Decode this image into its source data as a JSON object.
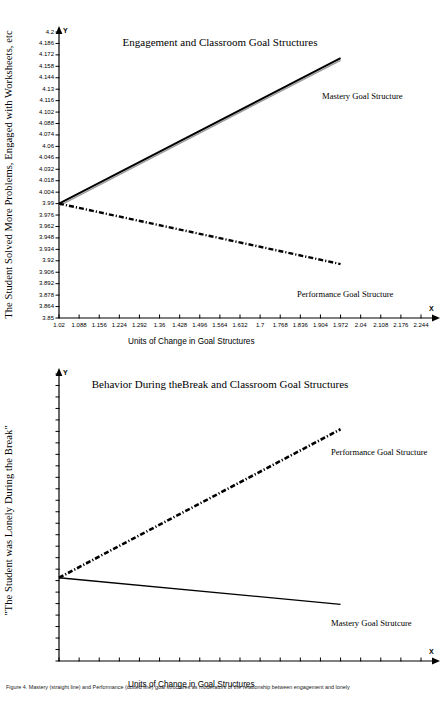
{
  "colors": {
    "ink": "#000000",
    "axis": "#000000",
    "page": "#ffffff"
  },
  "figures": [
    {
      "title": "Engagement and Classroom Goal Structures",
      "ylabel": "The Student Solved More Problems, Engaged with Worksheets, etc",
      "xlabel": "Units of Change in Goal Structures",
      "y_axis_mark": "Y",
      "x_axis_mark": "X",
      "series_labels": {
        "mastery": "Mastery Goal Structure",
        "performance": "Performance Goal Structure"
      },
      "chart_data": {
        "type": "line",
        "title": "Engagement and Classroom Goal Structures",
        "xlabel": "Units of Change in Goal Structures",
        "ylabel": "The Student Solved More Problems, Engaged with Worksheets, etc",
        "grid": false,
        "legend_position": "inline-right",
        "xlim": [
          1.02,
          2.244
        ],
        "ylim": [
          3.85,
          4.2
        ],
        "xticks": [
          1.02,
          1.088,
          1.156,
          1.224,
          1.292,
          1.36,
          1.428,
          1.496,
          1.564,
          1.632,
          1.7,
          1.768,
          1.836,
          1.904,
          1.972,
          2.04,
          2.108,
          2.176,
          2.244
        ],
        "yticks": [
          4.2,
          4.186,
          4.172,
          4.158,
          4.144,
          4.13,
          4.116,
          4.102,
          4.088,
          4.074,
          4.06,
          4.046,
          4.032,
          4.018,
          4.004,
          3.99,
          3.976,
          3.962,
          3.948,
          3.934,
          3.92,
          3.906,
          3.892,
          3.878,
          3.864,
          3.85
        ],
        "series": [
          {
            "name": "Mastery Goal Structure",
            "style": "solid",
            "x": [
              1.02,
              1.972
            ],
            "values": [
              3.99,
              4.168
            ]
          },
          {
            "name": "Performance Goal Structure",
            "style": "dash-dot",
            "x": [
              1.02,
              1.972
            ],
            "values": [
              3.99,
              3.916
            ]
          }
        ]
      }
    },
    {
      "title": "Behavior During theBreak and Classroom Goal Structures",
      "ylabel": "\"The Student was Lonely During the Break\"",
      "xlabel": "Units of Change in Goal Structures",
      "y_axis_mark": "Y",
      "x_axis_mark": "X",
      "series_labels": {
        "mastery": "Mastery Goal Strutcure",
        "performance": "Performance Goal Structure"
      },
      "chart_data": {
        "type": "line",
        "title": "Behavior During theBreak and Classroom Goal Structures",
        "xlabel": "Units of Change in Goal Structures",
        "ylabel": "\"The Student was Lonely During the Break\"",
        "grid": false,
        "legend_position": "inline-right",
        "xlim": [
          1.02,
          2.244
        ],
        "ylim": [
          4.4,
          4.8
        ],
        "xticks": [
          1.02,
          1.088,
          1.156,
          1.224,
          1.292,
          1.36,
          1.428,
          1.496,
          1.564,
          1.632,
          1.7,
          1.768,
          1.836,
          1.904,
          1.972,
          2.04,
          2.108,
          2.176,
          2.244
        ],
        "yticks": [
          4.8,
          4.784,
          4.768,
          4.752,
          4.736,
          4.72,
          4.704,
          4.688,
          4.672,
          4.656,
          4.64,
          4.624,
          4.608,
          4.592,
          4.576,
          4.56,
          4.544,
          4.528,
          4.512,
          4.496,
          4.48,
          4.464,
          4.448,
          4.432,
          4.416,
          4.4
        ],
        "series": [
          {
            "name": "Performance Goal Structure",
            "style": "dash-dot",
            "x": [
              1.02,
              1.972
            ],
            "values": [
              4.516,
              4.723
            ]
          },
          {
            "name": "Mastery Goal Strutcure",
            "style": "solid",
            "x": [
              1.02,
              1.972
            ],
            "values": [
              4.516,
              4.479
            ]
          }
        ]
      }
    }
  ],
  "caption": "Figure 4. Mastery (straight line) and Performance (dotted line) goal structures as moderators of the relationship between engagement and lonely"
}
